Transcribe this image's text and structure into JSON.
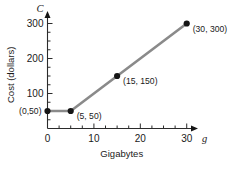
{
  "chart_data": {
    "type": "line",
    "title": "",
    "xlabel": "Gigabytes",
    "ylabel": "Cost (dollars)",
    "x_var": "g",
    "y_var": "C",
    "xlim": [
      0,
      32
    ],
    "ylim": [
      0,
      330
    ],
    "grid": false,
    "legend": null,
    "x_ticks": [
      0,
      10,
      20,
      30
    ],
    "x_tick_labels": [
      "0",
      "10",
      "20",
      "30"
    ],
    "x_minor_step": 2.5,
    "y_ticks": [
      100,
      200,
      300
    ],
    "y_tick_labels": [
      "100",
      "200",
      "300"
    ],
    "y_minor_step": 25,
    "series": [
      {
        "name": "Cost",
        "color": "#8a8a8a",
        "x": [
          0,
          5,
          15,
          30
        ],
        "y": [
          50,
          50,
          150,
          300
        ]
      }
    ],
    "point_labels": [
      {
        "text": "(0,50)",
        "x": 0,
        "y": 50,
        "align": "left"
      },
      {
        "text": "(5, 50)",
        "x": 5,
        "y": 50,
        "align": "right"
      },
      {
        "text": "(15, 150)",
        "x": 15,
        "y": 150,
        "align": "right"
      },
      {
        "text": "(30, 300)",
        "x": 30,
        "y": 300,
        "align": "right"
      }
    ]
  }
}
